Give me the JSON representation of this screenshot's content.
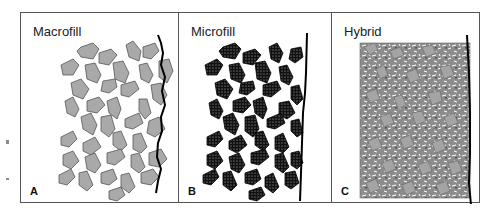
{
  "figure": {
    "panels": [
      {
        "id": "macrofill",
        "title": "Macrofill",
        "letter": "A",
        "filler_color": "#a9a9a9",
        "filler_stroke": "#555555",
        "texture": "solid"
      },
      {
        "id": "microfill",
        "title": "Microfill",
        "letter": "B",
        "filler_color": "#1a1a1a",
        "filler_stroke": "#000000",
        "texture": "speckled"
      },
      {
        "id": "hybrid",
        "title": "Hybrid",
        "letter": "C",
        "filler_color": "#a9a9a9",
        "filler_stroke": "#555555",
        "texture": "mixed-small-and-large"
      }
    ],
    "surface_line_color": "#000000",
    "border_color": "#555555"
  }
}
